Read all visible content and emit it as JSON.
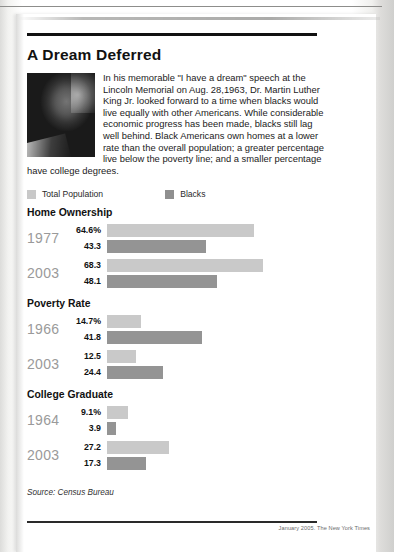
{
  "headline": "A Dream Deferred",
  "intro": "In his memorable \"I have a dream\" speech at the Lincoln Memorial on Aug. 28,1963, Dr. Martin Luther King Jr. looked forward to a time when blacks would live equally with other Americans. While considerable economic progress has been made, blacks still lag well behind. Black Americans own homes at a lower rate than the overall population; a greater percentage live below the poverty line; and a smaller percentage have college degrees.",
  "photo_caption": "martin-luther-king-jr-photo",
  "legend": [
    {
      "label": "Total Population",
      "color": "#c9c9c9"
    },
    {
      "label": "Blacks",
      "color": "#949494"
    }
  ],
  "source": "Source: Census Bureau",
  "credit": "January 2005. The New York Times",
  "chart_data": {
    "type": "bar",
    "title": "A Dream Deferred",
    "xlabel": "",
    "ylabel": "",
    "unit": "percent",
    "xlim": [
      0,
      70
    ],
    "grid": false,
    "legend_position": "top-left",
    "orientation": "horizontal",
    "series": [
      {
        "name": "Total Population",
        "color": "#c9c9c9"
      },
      {
        "name": "Blacks",
        "color": "#949494"
      }
    ],
    "groups": [
      {
        "title": "Home Ownership",
        "rows": [
          {
            "year": "1977",
            "total": "64.6%",
            "black": "43.3",
            "total_value": 64.6,
            "black_value": 43.3
          },
          {
            "year": "2003",
            "total": "68.3",
            "black": "48.1",
            "total_value": 68.3,
            "black_value": 48.1
          }
        ]
      },
      {
        "title": "Poverty Rate",
        "rows": [
          {
            "year": "1966",
            "total": "14.7%",
            "black": "41.8",
            "total_value": 14.7,
            "black_value": 41.8
          },
          {
            "year": "2003",
            "total": "12.5",
            "black": "24.4",
            "total_value": 12.5,
            "black_value": 24.4
          }
        ]
      },
      {
        "title": "College Graduate",
        "rows": [
          {
            "year": "1964",
            "total": "9.1%",
            "black": "3.9",
            "total_value": 9.1,
            "black_value": 3.9
          },
          {
            "year": "2003",
            "total": "27.2",
            "black": "17.3",
            "total_value": 27.2,
            "black_value": 17.3
          }
        ]
      }
    ]
  }
}
